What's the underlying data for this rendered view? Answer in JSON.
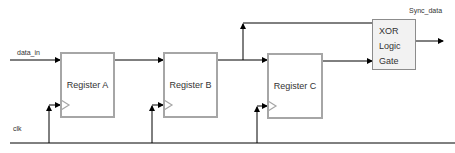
{
  "diagram": {
    "inputs": {
      "data_in": "data_in",
      "clk": "clk"
    },
    "output": "Sync_data",
    "blocks": [
      {
        "id": "A",
        "label": "Register A"
      },
      {
        "id": "B",
        "label": "Register B"
      },
      {
        "id": "C",
        "label": "Register C"
      }
    ],
    "gate": {
      "lines": [
        "XOR",
        "Logic",
        "Gate"
      ]
    },
    "colors": {
      "register_border": "#a6a6a6",
      "gate_fill": "#f2f2f2",
      "wire": "#000000"
    }
  }
}
